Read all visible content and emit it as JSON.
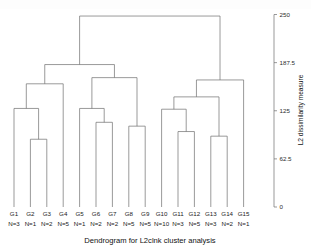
{
  "top_strip": {
    "ghost_text": ""
  },
  "chart_data": {
    "type": "dendrogram",
    "title": "",
    "xlabel": "Dendrogram for L2clnk cluster analysis",
    "ylabel": "L2 dissimilarity measure",
    "ylim": [
      0,
      250
    ],
    "yticks": [
      250,
      187.5,
      125,
      62.5,
      0
    ],
    "ytick_labels": [
      "250",
      "187.5",
      "125",
      "62.5",
      "0"
    ],
    "grid": false,
    "axis_position": "right",
    "leaf_labels": [
      "G1",
      "G2",
      "G3",
      "G4",
      "G5",
      "G6",
      "G7",
      "G8",
      "G9",
      "G10",
      "G11",
      "G12",
      "G13",
      "G14",
      "G15"
    ],
    "leaf_counts": [
      "N=3",
      "N=1",
      "N=2",
      "N=5",
      "N=1",
      "N=2",
      "N=2",
      "N=5",
      "N=5",
      "N=10",
      "N=3",
      "N=5",
      "N=3",
      "N=2",
      "N=1"
    ],
    "leaf_n_values": [
      3,
      1,
      2,
      5,
      1,
      2,
      2,
      5,
      5,
      10,
      3,
      5,
      3,
      2,
      1
    ],
    "merges": [
      {
        "id": "m1",
        "left": "G2",
        "right": "G3",
        "height": 88
      },
      {
        "id": "m2",
        "left": "G1",
        "right": "m1",
        "height": 128
      },
      {
        "id": "m3",
        "left": "m2",
        "right": "G4",
        "height": 160
      },
      {
        "id": "m4",
        "left": "G6",
        "right": "G7",
        "height": 110
      },
      {
        "id": "m5",
        "left": "G5",
        "right": "m4",
        "height": 128
      },
      {
        "id": "m6",
        "left": "G8",
        "right": "G9",
        "height": 105
      },
      {
        "id": "m7",
        "left": "m5",
        "right": "m6",
        "height": 168
      },
      {
        "id": "m8",
        "left": "m3",
        "right": "m7",
        "height": 185
      },
      {
        "id": "m9",
        "left": "G11",
        "right": "G12",
        "height": 98
      },
      {
        "id": "m10",
        "left": "G10",
        "right": "m9",
        "height": 127
      },
      {
        "id": "m11",
        "left": "G13",
        "right": "G14",
        "height": 92
      },
      {
        "id": "m12",
        "left": "m10",
        "right": "m11",
        "height": 143
      },
      {
        "id": "m13",
        "left": "m12",
        "right": "G15",
        "height": 165
      },
      {
        "id": "m14",
        "left": "m8",
        "right": "m13",
        "height": 248
      }
    ],
    "n_leaves": 15,
    "linkage": "complete (L2clnk)",
    "distance_metric": "L2"
  }
}
